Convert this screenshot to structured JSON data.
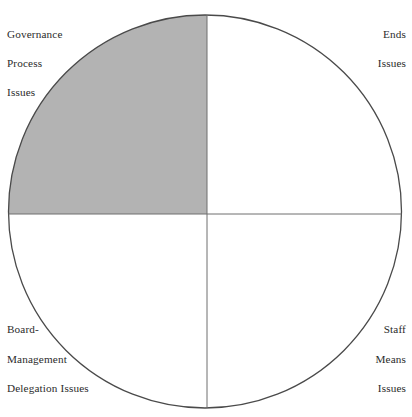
{
  "figure": {
    "type": "quadrant-circle-diagram",
    "shape": "circle",
    "background_color": "#ffffff",
    "circle": {
      "stroke_color": "#4a4a4a",
      "stroke_width": 1.3,
      "center_x": 205,
      "center_y": 211.5,
      "radius": 196.5
    },
    "divider": {
      "stroke_color": "#6e6e6e",
      "stroke_width": 1,
      "vertical_x": 207,
      "horizontal_y": 214
    },
    "quadrants": [
      {
        "id": "top-left",
        "label_lines": [
          "Governance",
          "Process",
          "Issues"
        ],
        "fill_color": "#b3b3b3",
        "shaded": true
      },
      {
        "id": "top-right",
        "label_lines": [
          "Ends",
          "Issues"
        ],
        "fill_color": "#ffffff",
        "shaded": false
      },
      {
        "id": "bottom-left",
        "label_lines": [
          "Board-",
          "Management",
          "Delegation Issues"
        ],
        "fill_color": "#ffffff",
        "shaded": false
      },
      {
        "id": "bottom-right",
        "label_lines": [
          "Staff",
          "Means",
          "Issues"
        ],
        "fill_color": "#ffffff",
        "shaded": false
      }
    ]
  }
}
